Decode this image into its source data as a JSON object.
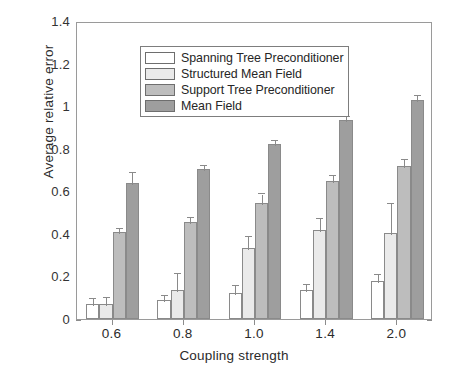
{
  "chart_data": {
    "type": "bar",
    "title": "",
    "xlabel": "Coupling strength",
    "ylabel": "Average relative error",
    "categories": [
      "0.6",
      "0.8",
      "1.0",
      "1.4",
      "2.0"
    ],
    "ylim": [
      0,
      1.4
    ],
    "yticks": [
      "0",
      "0.2",
      "0.4",
      "0.6",
      "0.8",
      "1",
      "1.2",
      "1.4"
    ],
    "ytick_values": [
      0,
      0.2,
      0.4,
      0.6,
      0.8,
      1.0,
      1.2,
      1.4
    ],
    "grid": false,
    "legend_position": "upper left",
    "series": [
      {
        "name": "Spanning Tree Preconditioner",
        "color": "#ffffff",
        "values": [
          0.07,
          0.09,
          0.12,
          0.135,
          0.18
        ],
        "errors": [
          0.025,
          0.018,
          0.035,
          0.025,
          0.025
        ]
      },
      {
        "name": "Structured Mean Field",
        "color": "#eaeaea",
        "values": [
          0.07,
          0.135,
          0.335,
          0.42,
          0.405
        ],
        "errors": [
          0.03,
          0.075,
          0.05,
          0.05,
          0.135
        ]
      },
      {
        "name": "Support Tree Preconditioner",
        "color": "#bdbdbd",
        "values": [
          0.41,
          0.455,
          0.545,
          0.65,
          0.72
        ],
        "errors": [
          0.012,
          0.018,
          0.04,
          0.022,
          0.028
        ]
      },
      {
        "name": "Mean Field",
        "color": "#9e9e9e",
        "values": [
          0.64,
          0.705,
          0.82,
          0.935,
          1.03
        ],
        "errors": [
          0.048,
          0.012,
          0.018,
          0.015,
          0.016
        ]
      }
    ]
  },
  "legend": {
    "items": [
      {
        "label": "Spanning Tree Preconditioner"
      },
      {
        "label": "Structured Mean Field"
      },
      {
        "label": "Support Tree Preconditioner"
      },
      {
        "label": "Mean Field"
      }
    ]
  }
}
